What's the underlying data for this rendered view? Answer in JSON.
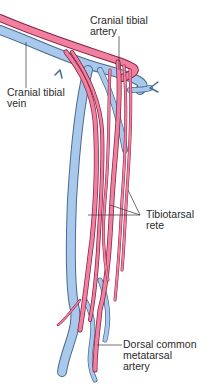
{
  "diagram": {
    "colors": {
      "artery": "#f080a0",
      "artery_outline": "#8a2040",
      "vein": "#a8c8ec",
      "vein_outline": "#4a6a90",
      "leader": "#333333"
    },
    "labels": {
      "cranial_tibial_artery": [
        "Cranial tibial",
        "artery"
      ],
      "cranial_tibial_vein": [
        "Cranial tibial",
        "vein"
      ],
      "tibiotarsal_rete": [
        "Tibiotarsal",
        "rete"
      ],
      "dorsal_common_metatarsal_artery": [
        "Dorsal common",
        "metatarsal",
        "artery"
      ]
    }
  }
}
